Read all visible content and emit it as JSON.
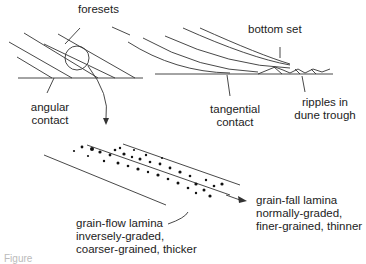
{
  "diagram": {
    "type": "cross-bedding foreset illustration",
    "labels": {
      "foresets": "foresets",
      "bottom_set": "bottom set",
      "angular_contact": [
        "angular",
        "contact"
      ],
      "tangential_contact": [
        "tangential",
        "contact"
      ],
      "ripples": [
        "ripples in",
        "dune trough"
      ],
      "grain_flow": [
        "grain-flow lamina",
        "inversely-graded,",
        "coarser-grained, thicker"
      ],
      "grain_fall": [
        "grain-fall lamina",
        "normally-graded,",
        "finer-grained, thinner"
      ]
    },
    "caption": "Figure"
  },
  "colors": {
    "line": "#333333",
    "text": "#222222",
    "stipple": "#cccccc"
  }
}
